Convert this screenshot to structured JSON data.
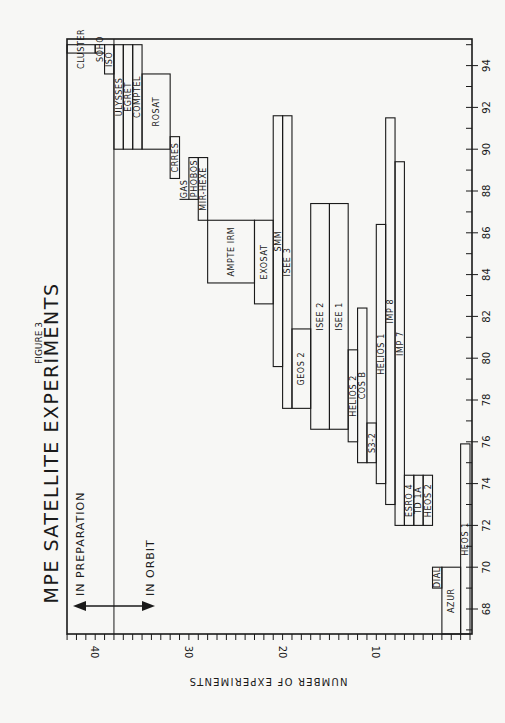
{
  "chart_data": {
    "type": "bar",
    "subtype": "gantt-staircase (rotated 90°)",
    "figure_label": "FIGURE 3",
    "title": "MPE SATELLITE EXPERIMENTS",
    "xlabel": "",
    "ylabel": "NUMBER OF EXPERIMENTS",
    "year_axis": {
      "range": [
        68,
        95
      ],
      "ticks": [
        68,
        70,
        72,
        74,
        76,
        78,
        80,
        82,
        84,
        86,
        88,
        90,
        92,
        94
      ]
    },
    "count_axis": {
      "range": [
        0,
        43
      ],
      "ticks": [
        10,
        20,
        30,
        40
      ]
    },
    "annotations": {
      "in_preparation": "IN PREPARATION",
      "in_orbit": "IN ORBIT",
      "divider_count": 38
    },
    "series": [
      {
        "name": "HEOS 1",
        "count_from": 0,
        "count_to": 1,
        "start": 68.0,
        "end": 75.9
      },
      {
        "name": "AZUR",
        "count_from": 1,
        "count_to": 3,
        "start": 68.0,
        "end": 70.0
      },
      {
        "name": "DIAL",
        "count_from": 3,
        "count_to": 4,
        "start": 69.0,
        "end": 70.0
      },
      {
        "name": "HEOS 2",
        "count_from": 4,
        "count_to": 5,
        "start": 72.0,
        "end": 74.4
      },
      {
        "name": "TD 1A",
        "count_from": 5,
        "count_to": 6,
        "start": 72.0,
        "end": 74.4
      },
      {
        "name": "ESRO 4",
        "count_from": 6,
        "count_to": 7,
        "start": 72.0,
        "end": 74.4
      },
      {
        "name": "IMP 7",
        "count_from": 7,
        "count_to": 8,
        "start": 72.0,
        "end": 89.4
      },
      {
        "name": "IMP 8",
        "count_from": 8,
        "count_to": 9,
        "start": 73.0,
        "end": 91.5
      },
      {
        "name": "HELIOS 1",
        "count_from": 9,
        "count_to": 10,
        "start": 74.0,
        "end": 86.4
      },
      {
        "name": "S3-2",
        "count_from": 10,
        "count_to": 11,
        "start": 75.0,
        "end": 76.9
      },
      {
        "name": "COS B",
        "count_from": 11,
        "count_to": 12,
        "start": 75.0,
        "end": 82.4
      },
      {
        "name": "HELIOS 2",
        "count_from": 12,
        "count_to": 13,
        "start": 76.0,
        "end": 80.4
      },
      {
        "name": "ISEE 1",
        "count_from": 13,
        "count_to": 15,
        "start": 76.6,
        "end": 87.4
      },
      {
        "name": "ISEE 2",
        "count_from": 15,
        "count_to": 17,
        "start": 76.6,
        "end": 87.4
      },
      {
        "name": "GEOS 2",
        "count_from": 17,
        "count_to": 19,
        "start": 77.6,
        "end": 81.4
      },
      {
        "name": "ISEE 3",
        "count_from": 19,
        "count_to": 20,
        "start": 77.6,
        "end": 91.6
      },
      {
        "name": "SMM",
        "count_from": 20,
        "count_to": 21,
        "start": 79.6,
        "end": 91.6
      },
      {
        "name": "EXOSAT",
        "count_from": 21,
        "count_to": 23,
        "start": 82.6,
        "end": 86.6
      },
      {
        "name": "AMPTE IRM",
        "count_from": 23,
        "count_to": 28,
        "start": 83.6,
        "end": 86.6
      },
      {
        "name": "MIR-HEXE",
        "count_from": 28,
        "count_to": 29,
        "start": 86.6,
        "end": 89.6
      },
      {
        "name": "PHOBOS",
        "count_from": 29,
        "count_to": 30,
        "start": 87.6,
        "end": 89.6
      },
      {
        "name": "GAS",
        "count_from": 30,
        "count_to": 31,
        "start": 87.6,
        "end": 88.6,
        "open": true
      },
      {
        "name": "CRRES",
        "count_from": 31,
        "count_to": 32,
        "start": 88.6,
        "end": 90.6
      },
      {
        "name": "ROSAT",
        "count_from": 32,
        "count_to": 35,
        "start": 90.0,
        "end": 93.6
      },
      {
        "name": "COMPTEL",
        "count_from": 35,
        "count_to": 36,
        "start": 90.0,
        "end": 95.0
      },
      {
        "name": "EGRET",
        "count_from": 36,
        "count_to": 37,
        "start": 90.0,
        "end": 95.0
      },
      {
        "name": "ULYSSES",
        "count_from": 37,
        "count_to": 38,
        "start": 90.0,
        "end": 95.0
      },
      {
        "name": "ISO",
        "count_from": 38,
        "count_to": 39,
        "start": 93.6,
        "end": 95.0
      },
      {
        "name": "SOHO",
        "count_from": 39,
        "count_to": 40,
        "start": 94.6,
        "end": 95.0
      },
      {
        "name": "CLUSTER",
        "count_from": 40,
        "count_to": 43,
        "start": 94.6,
        "end": 95.0
      }
    ],
    "grid": false,
    "legend": null
  }
}
